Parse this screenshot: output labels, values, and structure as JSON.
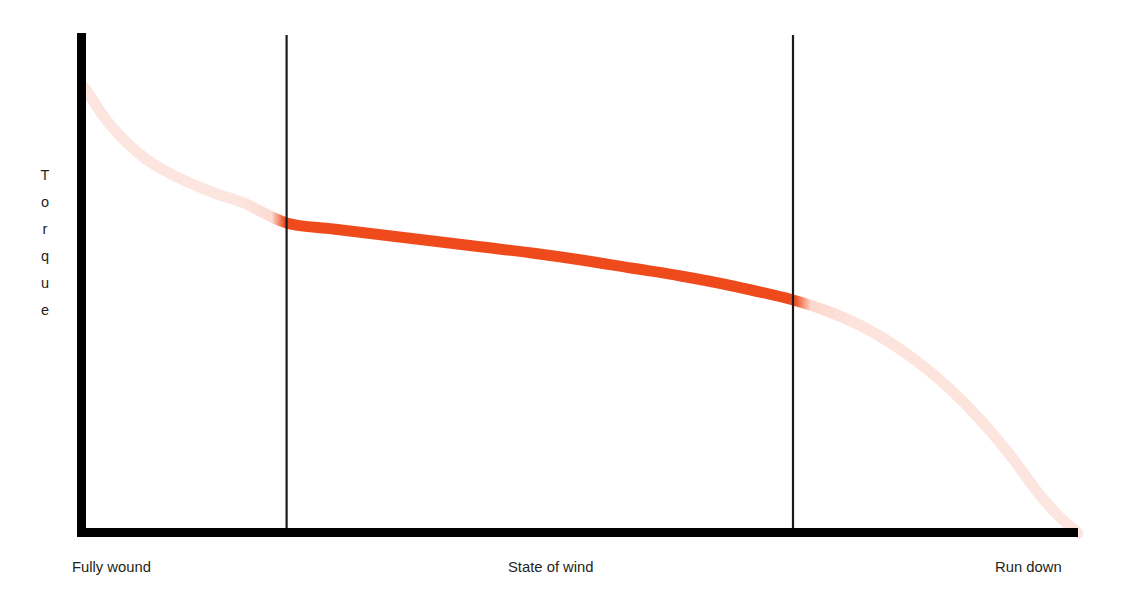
{
  "figure": {
    "background_color": "#ffffff",
    "axis_color": "#000000",
    "divider_color": "#1a1a1a",
    "text_color": "#231f20"
  },
  "y_axis": {
    "label": "Torque",
    "letters": [
      "T",
      "o",
      "r",
      "q",
      "u",
      "e"
    ]
  },
  "x_axis": {
    "label_left": "Fully wound",
    "label_center": "State of wind",
    "label_right": "Run down"
  },
  "chart_data": {
    "type": "line",
    "title": "",
    "subtitle": "",
    "xlabel": "State of wind",
    "ylabel": "Torque",
    "xlim": [
      0,
      100
    ],
    "ylim": [
      0,
      100
    ],
    "grid": false,
    "legend_position": "none",
    "axis_tick_labels": {
      "x": [
        "Fully wound",
        "State of wind",
        "Run down"
      ],
      "y": []
    },
    "annotations": [
      {
        "text": "Fully wound",
        "position": "x-axis-left"
      },
      {
        "text": "State of wind",
        "position": "x-axis-center"
      },
      {
        "text": "Run down",
        "position": "x-axis-right"
      }
    ],
    "vertical_dividers_x": [
      20.3,
      71.3
    ],
    "series": [
      {
        "name": "Mainspring torque",
        "solid_color": "#ee4a1c",
        "faded_color": "#ee4a1c",
        "faded_opacity": 0.14,
        "solid_range_x": [
          20.3,
          71.3
        ],
        "x": [
          0,
          2,
          4,
          6,
          8,
          10,
          13,
          16,
          20.3,
          25,
          30,
          35,
          40,
          45,
          50,
          55,
          60,
          65,
          71.3,
          75,
          78,
          81,
          84,
          87,
          90,
          93,
          96,
          98,
          100
        ],
        "y": [
          89,
          83,
          78.5,
          75,
          72.5,
          70.5,
          68,
          66,
          62,
          60.8,
          59.6,
          58.4,
          57.2,
          56,
          54.6,
          53,
          51.4,
          49.5,
          46.6,
          44.2,
          41.6,
          38.2,
          34,
          29,
          23,
          16,
          8,
          3.5,
          0
        ]
      }
    ]
  }
}
